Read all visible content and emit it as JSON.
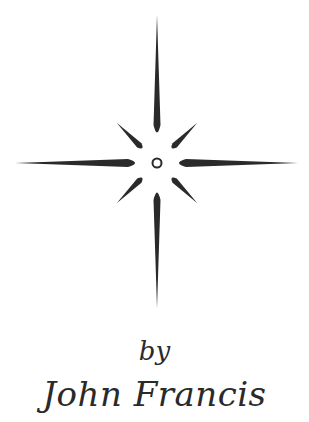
{
  "byline": "by",
  "author": "John Francis",
  "star": {
    "icon": "compass-star-icon",
    "color": "#2a2a2a"
  }
}
